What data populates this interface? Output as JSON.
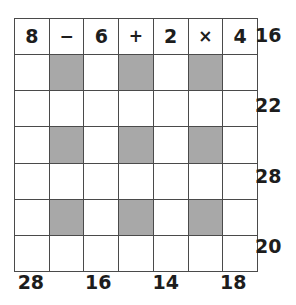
{
  "puzzle": {
    "grid": {
      "rows": 7,
      "columns": 7,
      "shaded_color": "#a8a8a8",
      "border_color": "#4a4a4a",
      "background_color": "#ffffff",
      "cells": [
        [
          {
            "text": "8",
            "shaded": false,
            "kind": "number"
          },
          {
            "text": "−",
            "shaded": false,
            "kind": "operator"
          },
          {
            "text": "6",
            "shaded": false,
            "kind": "number"
          },
          {
            "text": "+",
            "shaded": false,
            "kind": "operator"
          },
          {
            "text": "2",
            "shaded": false,
            "kind": "number"
          },
          {
            "text": "×",
            "shaded": false,
            "kind": "operator"
          },
          {
            "text": "4",
            "shaded": false,
            "kind": "number"
          }
        ],
        [
          {
            "text": "",
            "shaded": false,
            "kind": "number"
          },
          {
            "text": "",
            "shaded": true,
            "kind": "operator"
          },
          {
            "text": "",
            "shaded": false,
            "kind": "number"
          },
          {
            "text": "",
            "shaded": true,
            "kind": "operator"
          },
          {
            "text": "",
            "shaded": false,
            "kind": "number"
          },
          {
            "text": "",
            "shaded": true,
            "kind": "operator"
          },
          {
            "text": "",
            "shaded": false,
            "kind": "number"
          }
        ],
        [
          {
            "text": "",
            "shaded": false,
            "kind": "number"
          },
          {
            "text": "",
            "shaded": false,
            "kind": "operator"
          },
          {
            "text": "",
            "shaded": false,
            "kind": "number"
          },
          {
            "text": "",
            "shaded": false,
            "kind": "operator"
          },
          {
            "text": "",
            "shaded": false,
            "kind": "number"
          },
          {
            "text": "",
            "shaded": false,
            "kind": "operator"
          },
          {
            "text": "",
            "shaded": false,
            "kind": "number"
          }
        ],
        [
          {
            "text": "",
            "shaded": false,
            "kind": "number"
          },
          {
            "text": "",
            "shaded": true,
            "kind": "operator"
          },
          {
            "text": "",
            "shaded": false,
            "kind": "number"
          },
          {
            "text": "",
            "shaded": true,
            "kind": "operator"
          },
          {
            "text": "",
            "shaded": false,
            "kind": "number"
          },
          {
            "text": "",
            "shaded": true,
            "kind": "operator"
          },
          {
            "text": "",
            "shaded": false,
            "kind": "number"
          }
        ],
        [
          {
            "text": "",
            "shaded": false,
            "kind": "number"
          },
          {
            "text": "",
            "shaded": false,
            "kind": "operator"
          },
          {
            "text": "",
            "shaded": false,
            "kind": "number"
          },
          {
            "text": "",
            "shaded": false,
            "kind": "operator"
          },
          {
            "text": "",
            "shaded": false,
            "kind": "number"
          },
          {
            "text": "",
            "shaded": false,
            "kind": "operator"
          },
          {
            "text": "",
            "shaded": false,
            "kind": "number"
          }
        ],
        [
          {
            "text": "",
            "shaded": false,
            "kind": "number"
          },
          {
            "text": "",
            "shaded": true,
            "kind": "operator"
          },
          {
            "text": "",
            "shaded": false,
            "kind": "number"
          },
          {
            "text": "",
            "shaded": true,
            "kind": "operator"
          },
          {
            "text": "",
            "shaded": false,
            "kind": "number"
          },
          {
            "text": "",
            "shaded": true,
            "kind": "operator"
          },
          {
            "text": "",
            "shaded": false,
            "kind": "number"
          }
        ],
        [
          {
            "text": "",
            "shaded": false,
            "kind": "number"
          },
          {
            "text": "",
            "shaded": false,
            "kind": "operator"
          },
          {
            "text": "",
            "shaded": false,
            "kind": "number"
          },
          {
            "text": "",
            "shaded": false,
            "kind": "operator"
          },
          {
            "text": "",
            "shaded": false,
            "kind": "number"
          },
          {
            "text": "",
            "shaded": false,
            "kind": "operator"
          },
          {
            "text": "",
            "shaded": false,
            "kind": "number"
          }
        ]
      ]
    },
    "row_totals": [
      "16",
      "22",
      "28",
      "20"
    ],
    "column_totals": [
      "28",
      "16",
      "14",
      "18"
    ]
  }
}
